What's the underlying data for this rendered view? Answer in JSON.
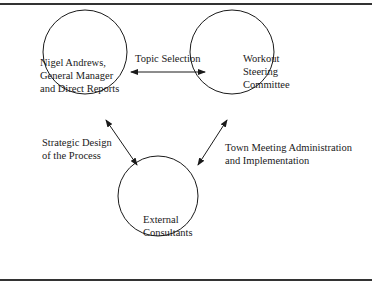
{
  "nodes": {
    "nigel": [
      "Nigel Andrews,",
      "General Manager",
      "and Direct Reports"
    ],
    "steering": [
      "Workout",
      "Steering",
      "Committee"
    ],
    "consultants": [
      "External",
      "Consultants"
    ]
  },
  "edges": {
    "topic": [
      "Topic Selection"
    ],
    "strategic": [
      "Strategic Design",
      "of the Process"
    ],
    "town": [
      "Town Meeting Administration",
      "and Implementation"
    ]
  }
}
